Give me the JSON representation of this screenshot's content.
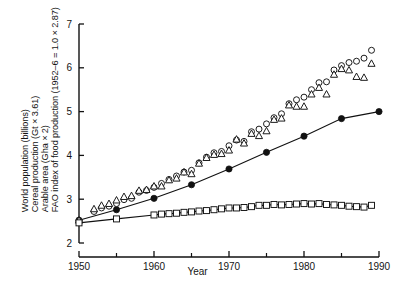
{
  "chart_data": {
    "type": "scatter",
    "title": "",
    "xlabel": "Year",
    "ylabel_lines": [
      "World population (billions)",
      "Cereal production (Gt × 3.61)",
      "Arable area (Gha × 2)",
      "FAO index of food production (1952–6 = 1.0 × 2.87)"
    ],
    "xlim": [
      1950,
      1990
    ],
    "ylim": [
      2,
      7
    ],
    "xticks": [
      1950,
      1960,
      1970,
      1980,
      1990
    ],
    "xticklabels": [
      "1950",
      "1960",
      "1970",
      "1980",
      "1990"
    ],
    "xminorticks": [
      1955,
      1965,
      1975,
      1985
    ],
    "yticks": [
      2,
      3,
      4,
      5,
      6,
      7
    ],
    "yticklabels": [
      "2",
      "3",
      "4",
      "5",
      "6",
      "7"
    ],
    "grid": false,
    "legend": "none",
    "line_color": "#111111",
    "marker_color": "#111111",
    "series": [
      {
        "name": "World population (billions)",
        "marker": "filled-circle",
        "connected": true,
        "x": [
          1950,
          1955,
          1960,
          1965,
          1970,
          1975,
          1980,
          1985,
          1990
        ],
        "values": [
          2.52,
          2.76,
          3.02,
          3.33,
          3.69,
          4.07,
          4.44,
          4.84,
          5.0
        ]
      },
      {
        "name": "FAO index of food production (1952-6 = 1.0 x 2.87)",
        "marker": "open-circle",
        "connected": false,
        "x": [
          1950,
          1952,
          1953,
          1954,
          1955,
          1956,
          1957,
          1958,
          1959,
          1960,
          1961,
          1962,
          1963,
          1964,
          1965,
          1966,
          1967,
          1968,
          1969,
          1970,
          1971,
          1972,
          1973,
          1974,
          1975,
          1976,
          1977,
          1978,
          1979,
          1980,
          1981,
          1982,
          1983,
          1984,
          1985,
          1986,
          1987,
          1988,
          1989
        ],
        "values": [
          2.5,
          2.72,
          2.8,
          2.84,
          2.9,
          2.99,
          3.02,
          3.16,
          3.2,
          3.27,
          3.36,
          3.45,
          3.53,
          3.62,
          3.66,
          3.83,
          3.96,
          4.06,
          4.09,
          4.22,
          4.35,
          4.32,
          4.54,
          4.6,
          4.72,
          4.86,
          4.95,
          5.18,
          5.27,
          5.33,
          5.5,
          5.66,
          5.68,
          5.95,
          6.05,
          6.12,
          6.15,
          6.22,
          6.4
        ]
      },
      {
        "name": "Cereal production (Gt x 3.61)",
        "marker": "open-triangle",
        "connected": false,
        "x": [
          1950,
          1952,
          1953,
          1954,
          1955,
          1956,
          1957,
          1958,
          1959,
          1960,
          1961,
          1962,
          1963,
          1964,
          1965,
          1966,
          1967,
          1968,
          1969,
          1970,
          1971,
          1972,
          1973,
          1974,
          1975,
          1976,
          1977,
          1978,
          1979,
          1980,
          1981,
          1982,
          1983,
          1984,
          1985,
          1986,
          1987,
          1988,
          1989
        ],
        "values": [
          2.52,
          2.78,
          2.86,
          2.9,
          2.98,
          3.06,
          3.08,
          3.2,
          3.22,
          3.3,
          3.3,
          3.44,
          3.48,
          3.62,
          3.58,
          3.82,
          3.95,
          4.02,
          4.04,
          4.12,
          4.37,
          4.28,
          4.5,
          4.45,
          4.56,
          4.82,
          4.85,
          5.15,
          5.12,
          5.12,
          5.4,
          5.55,
          5.4,
          5.85,
          5.98,
          5.95,
          5.8,
          5.78,
          6.1
        ]
      },
      {
        "name": "Arable area (Gha x 2)",
        "marker": "open-square",
        "connected": true,
        "x": [
          1950,
          1955,
          1960,
          1961,
          1962,
          1963,
          1964,
          1965,
          1966,
          1967,
          1968,
          1969,
          1970,
          1971,
          1972,
          1973,
          1974,
          1975,
          1976,
          1977,
          1978,
          1979,
          1980,
          1981,
          1982,
          1983,
          1984,
          1985,
          1986,
          1987,
          1988,
          1989
        ],
        "values": [
          2.46,
          2.55,
          2.64,
          2.66,
          2.67,
          2.68,
          2.7,
          2.71,
          2.73,
          2.74,
          2.76,
          2.78,
          2.8,
          2.8,
          2.81,
          2.83,
          2.86,
          2.86,
          2.88,
          2.87,
          2.88,
          2.89,
          2.9,
          2.89,
          2.9,
          2.88,
          2.87,
          2.86,
          2.84,
          2.83,
          2.82,
          2.86
        ]
      }
    ]
  }
}
